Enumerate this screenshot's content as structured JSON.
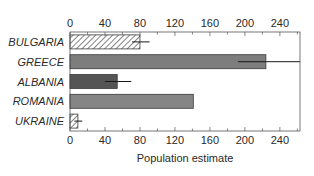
{
  "chart_data": {
    "type": "bar",
    "orientation": "horizontal",
    "title": "",
    "xlabel": "Population estimate",
    "ylabel": "",
    "xlim": [
      0,
      263
    ],
    "xticks": [
      0,
      40,
      80,
      120,
      160,
      200,
      240
    ],
    "minor_tick_step": 20,
    "ticks_top_and_bottom": true,
    "grid": false,
    "legend": null,
    "categories": [
      "BULGARIA",
      "GREECE",
      "ALBANIA",
      "ROMANIA",
      "UKRAINE"
    ],
    "values": [
      80,
      224,
      54,
      141,
      9
    ],
    "error_low": [
      71,
      192,
      40,
      null,
      5
    ],
    "error_high": [
      91,
      263,
      70,
      null,
      14
    ],
    "bar_styles": [
      "hatched",
      "solid",
      "solid",
      "solid",
      "hatched"
    ],
    "bar_colors": [
      "#ffffff",
      "#7d7d7d",
      "#555555",
      "#858585",
      "#ffffff"
    ]
  },
  "colors": {
    "axis": "#555555",
    "text": "#2a2a2a",
    "error_bar": "#1a1a1a",
    "bar_edge": "#3a3a3a"
  }
}
